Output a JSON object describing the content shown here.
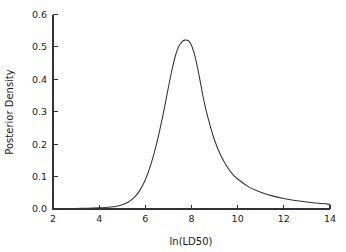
{
  "chart_data": {
    "type": "line",
    "title": "",
    "subtitle": "",
    "xlabel": "ln(LD50)",
    "ylabel": "Posterior Density",
    "xlim": [
      2,
      14
    ],
    "ylim": [
      0,
      0.6
    ],
    "xticks": [
      2,
      4,
      6,
      8,
      10,
      12,
      14
    ],
    "xticklabels": [
      "2",
      "4",
      "6",
      "8",
      "10",
      "12",
      "14"
    ],
    "yticks": [
      0.0,
      0.1,
      0.2,
      0.3,
      0.4,
      0.5,
      0.6
    ],
    "yticklabels": [
      "0.0",
      "0.1",
      "0.2",
      "0.3",
      "0.4",
      "0.5",
      "0.6"
    ],
    "grid": false,
    "legend": null,
    "legend_position": "none",
    "annotations": [],
    "peak": {
      "x": 7.85,
      "y": 0.52
    },
    "series": [
      {
        "name": "Posterior density of ln(LD50)",
        "color": "#333333",
        "x": [
          2.0,
          2.25,
          2.5,
          2.75,
          3.0,
          3.25,
          3.5,
          3.75,
          4.0,
          4.25,
          4.5,
          4.75,
          5.0,
          5.25,
          5.5,
          5.75,
          6.0,
          6.25,
          6.5,
          6.75,
          7.0,
          7.15,
          7.3,
          7.45,
          7.6,
          7.7,
          7.85,
          7.95,
          8.1,
          8.25,
          8.4,
          8.55,
          8.75,
          9.0,
          9.25,
          9.5,
          9.75,
          10.0,
          10.5,
          11.0,
          11.5,
          12.0,
          12.5,
          13.0,
          13.5,
          14.0
        ],
        "y": [
          0.001,
          0.001,
          0.0012,
          0.0014,
          0.0016,
          0.0019,
          0.0023,
          0.0028,
          0.0035,
          0.0045,
          0.006,
          0.0085,
          0.013,
          0.021,
          0.034,
          0.056,
          0.09,
          0.14,
          0.205,
          0.285,
          0.375,
          0.428,
          0.472,
          0.502,
          0.517,
          0.521,
          0.52,
          0.512,
          0.485,
          0.44,
          0.385,
          0.33,
          0.272,
          0.212,
          0.168,
          0.135,
          0.11,
          0.0925,
          0.0675,
          0.0515,
          0.0405,
          0.0325,
          0.0265,
          0.0215,
          0.0175,
          0.0145
        ]
      }
    ]
  },
  "axes": {
    "x_axis_label": "ln(LD50)",
    "y_axis_label": "Posterior Density"
  }
}
